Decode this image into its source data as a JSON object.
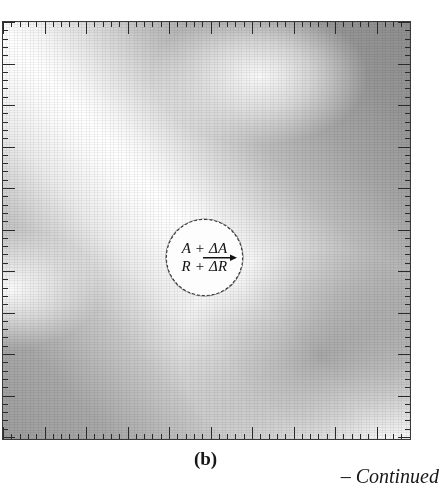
{
  "figure": {
    "panel_label": "(b)",
    "continuation_note": "– Continued",
    "callout": {
      "numerator": "A + ΔA",
      "denominator": "R + ΔR",
      "arrow": "right-arrow",
      "shape": "circle",
      "border_style": "dashed"
    },
    "axes": {
      "ruler_edges": [
        "top",
        "right",
        "bottom",
        "left"
      ],
      "minor_tick_spacing_px": 8.3,
      "major_every_n_minor": 5,
      "minor_tick_length_px": 5,
      "major_tick_length_px": 12
    },
    "colors": {
      "frame": "#3a3a3a",
      "tick": "#2a2a2a",
      "field_light": "#ffffff",
      "field_mid": "#b9b9b9",
      "field_dark": "#8b8b8b",
      "callout_fill": "#fdfdfd",
      "text": "#171717",
      "background": "#ffffff"
    }
  },
  "chart_data": {
    "type": "heatmap",
    "title": "(b)",
    "xlabel": "",
    "ylabel": "",
    "grid": false,
    "legend": false,
    "annotations": [
      {
        "text": "A + ΔA",
        "role": "callout-numerator"
      },
      {
        "text": "R + ΔR",
        "role": "callout-denominator"
      },
      {
        "text": "(b)",
        "role": "panel-label"
      },
      {
        "text": "– Continued",
        "role": "continuation-note"
      }
    ],
    "xlim": [
      0,
      49
    ],
    "ylim": [
      0,
      50
    ]
  }
}
